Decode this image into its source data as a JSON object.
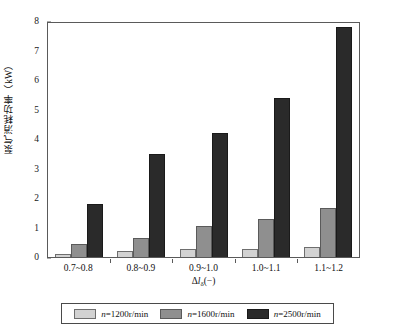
{
  "chart_data": {
    "type": "bar",
    "title": "",
    "xlabel": "Δlδ(−)",
    "ylabel": "泵气消耗功率（kW）",
    "categories": [
      "0.7~0.8",
      "0.8~0.9",
      "0.9~1.0",
      "1.0~1.1",
      "1.1~1.2"
    ],
    "series": [
      {
        "name": "n=1200r/min",
        "values": [
          0.1,
          0.2,
          0.27,
          0.27,
          0.35
        ],
        "color": "#d2d2d2"
      },
      {
        "name": "n=1600r/min",
        "values": [
          0.45,
          0.65,
          1.05,
          1.3,
          1.65
        ],
        "color": "#8f8f8f"
      },
      {
        "name": "n=2500r/min",
        "values": [
          1.8,
          3.5,
          4.2,
          5.4,
          7.8
        ],
        "color": "#2a2a2a"
      }
    ],
    "ylim": [
      0,
      8
    ],
    "yticks": [
      0,
      1,
      2,
      3,
      4,
      5,
      6,
      7,
      8
    ],
    "ytick_labels": [
      "0",
      "1",
      "2",
      "3",
      "4",
      "5",
      "6",
      "7",
      "8"
    ],
    "grid": false,
    "legend_position": "bottom"
  },
  "axis": {
    "y_title": "泵气消耗功率（kW）",
    "x_title_delta": "Δ",
    "x_title_l": "l",
    "x_title_sub": "δ",
    "x_title_unit": "(−)"
  },
  "legend": {
    "items": [
      {
        "label": "n=1200r/min",
        "prefix": "n",
        "rest": "=1200r/min"
      },
      {
        "label": "n=1600r/min",
        "prefix": "n",
        "rest": "=1600r/min"
      },
      {
        "label": "n=2500r/min",
        "prefix": "n",
        "rest": "=2500r/min"
      }
    ]
  }
}
